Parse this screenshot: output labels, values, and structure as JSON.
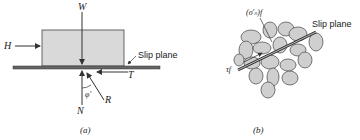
{
  "panel_a": {
    "caption": "(a)",
    "labels": {
      "weight": "W",
      "horizontal_force": "H",
      "slip_plane": "Slip plane",
      "shear_force": "T",
      "normal_force": "N",
      "resultant": "R",
      "friction_angle": "φ'"
    },
    "colors": {
      "block_fill": "#d9d9d9",
      "line": "#333333",
      "plane": "#555555"
    }
  },
  "panel_b": {
    "caption": "(b)",
    "labels": {
      "effective_normal_stress": "(σ'ₙ)f",
      "shear_stress": "τf",
      "slip_plane": "Slip plane"
    },
    "colors": {
      "grain_fill": "#cfcfcf",
      "grain_stroke": "#555555"
    }
  }
}
